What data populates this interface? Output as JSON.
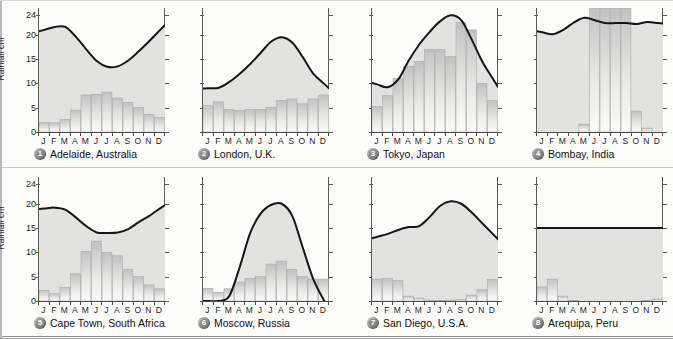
{
  "figure": {
    "axis_label": "Rainfall cm",
    "y_ticks": [
      "24",
      "20",
      "15",
      "10",
      "5",
      "0"
    ],
    "y_tick_values": [
      24,
      20,
      15,
      10,
      5,
      0
    ],
    "y_min": 0,
    "y_max": 25.5,
    "months": [
      "J",
      "F",
      "M",
      "A",
      "M",
      "J",
      "J",
      "A",
      "S",
      "O",
      "N",
      "D"
    ],
    "curve_color": "#151515",
    "bar_color": "#c9c9c9",
    "fill_color": "#e2e2e0",
    "badge_color": "#8b8b8b"
  },
  "chart_data": [
    {
      "type": "bar",
      "id": "1",
      "title": "Adelaide, Australia",
      "ylabel": "Rainfall cm",
      "xlabel": "",
      "ylim": [
        0,
        25.5
      ],
      "categories": [
        "J",
        "F",
        "M",
        "A",
        "M",
        "J",
        "J",
        "A",
        "S",
        "O",
        "N",
        "D"
      ],
      "series": [
        {
          "name": "Rainfall",
          "kind": "bar",
          "values": [
            1.9,
            1.9,
            2.6,
            4.5,
            7.6,
            7.7,
            8.2,
            7.0,
            6.1,
            5.0,
            3.6,
            3.0
          ]
        },
        {
          "name": "Temperature curve",
          "kind": "line",
          "values": [
            21.0,
            21.6,
            21.6,
            19.6,
            17.0,
            14.6,
            13.4,
            13.5,
            14.7,
            16.6,
            18.7,
            20.9
          ]
        }
      ]
    },
    {
      "type": "bar",
      "id": "2",
      "title": "London, U.K.",
      "ylabel": "",
      "xlabel": "",
      "ylim": [
        0,
        25.5
      ],
      "categories": [
        "J",
        "F",
        "M",
        "A",
        "M",
        "J",
        "J",
        "A",
        "S",
        "O",
        "N",
        "D"
      ],
      "series": [
        {
          "name": "Rainfall",
          "kind": "bar",
          "values": [
            5.4,
            6.2,
            4.6,
            4.4,
            4.6,
            4.6,
            5.0,
            6.5,
            6.8,
            5.8,
            6.8,
            7.6
          ]
        },
        {
          "name": "Temperature curve",
          "kind": "line",
          "values": [
            9.0,
            9.1,
            10.3,
            12.0,
            14.0,
            16.3,
            18.6,
            19.5,
            18.4,
            15.4,
            12.0,
            10.0
          ]
        }
      ]
    },
    {
      "type": "bar",
      "id": "3",
      "title": "Tokyo, Japan",
      "ylabel": "",
      "xlabel": "",
      "ylim": [
        0,
        25.5
      ],
      "categories": [
        "J",
        "F",
        "M",
        "A",
        "M",
        "J",
        "J",
        "A",
        "S",
        "O",
        "N",
        "D"
      ],
      "series": [
        {
          "name": "Rainfall",
          "kind": "bar",
          "values": [
            5.2,
            7.5,
            11.0,
            13.5,
            14.5,
            17.0,
            17.0,
            15.5,
            22.5,
            21.0,
            10.0,
            6.5
          ]
        },
        {
          "name": "Temperature curve",
          "kind": "line",
          "values": [
            9.8,
            9.2,
            10.8,
            14.7,
            18.0,
            20.6,
            22.8,
            24.0,
            23.0,
            19.0,
            14.5,
            11.0
          ]
        }
      ]
    },
    {
      "type": "bar",
      "id": "4",
      "title": "Bombay, India",
      "ylabel": "",
      "xlabel": "",
      "ylim": [
        0,
        25.5
      ],
      "categories": [
        "J",
        "F",
        "M",
        "A",
        "M",
        "J",
        "J",
        "A",
        "S",
        "O",
        "N",
        "D"
      ],
      "series": [
        {
          "name": "Rainfall",
          "kind": "bar",
          "values": [
            0.0,
            0.0,
            0.0,
            0.0,
            1.6,
            25.5,
            25.5,
            25.5,
            25.5,
            4.3,
            0.8,
            0.0
          ]
        },
        {
          "name": "Temperature curve",
          "kind": "line",
          "values": [
            20.5,
            20.1,
            21.0,
            22.5,
            23.5,
            23.0,
            22.4,
            22.4,
            22.4,
            22.2,
            22.6,
            22.4
          ]
        }
      ]
    },
    {
      "type": "bar",
      "id": "5",
      "title": "Cape Town, South Africa",
      "ylabel": "Rainfall cm",
      "xlabel": "",
      "ylim": [
        0,
        25.5
      ],
      "categories": [
        "J",
        "F",
        "M",
        "A",
        "M",
        "J",
        "J",
        "A",
        "S",
        "O",
        "N",
        "D"
      ],
      "series": [
        {
          "name": "Rainfall",
          "kind": "bar",
          "values": [
            2.2,
            1.5,
            2.8,
            5.6,
            10.2,
            12.3,
            10.0,
            9.3,
            6.5,
            5.0,
            3.3,
            2.5
          ]
        },
        {
          "name": "Temperature curve",
          "kind": "line",
          "values": [
            19.0,
            19.2,
            18.8,
            17.2,
            15.4,
            14.1,
            14.0,
            14.1,
            14.8,
            16.2,
            17.5,
            19.0
          ]
        }
      ]
    },
    {
      "type": "bar",
      "id": "6",
      "title": "Moscow, Russia",
      "ylabel": "",
      "xlabel": "",
      "ylim": [
        0,
        25.5
      ],
      "categories": [
        "J",
        "F",
        "M",
        "A",
        "M",
        "J",
        "J",
        "A",
        "S",
        "O",
        "N",
        "D"
      ],
      "series": [
        {
          "name": "Rainfall",
          "kind": "bar",
          "values": [
            2.6,
            1.8,
            2.5,
            3.9,
            4.6,
            5.0,
            7.6,
            8.2,
            6.5,
            5.0,
            4.5,
            4.5
          ]
        },
        {
          "name": "Temperature curve",
          "kind": "line",
          "values": [
            -0.5,
            -0.8,
            1.0,
            7.0,
            14.0,
            18.0,
            19.8,
            20.0,
            17.5,
            11.0,
            4.5,
            0.2
          ]
        }
      ]
    },
    {
      "type": "bar",
      "id": "7",
      "title": "San Diego, U.S.A.",
      "ylabel": "",
      "xlabel": "",
      "ylim": [
        0,
        25.5
      ],
      "categories": [
        "J",
        "F",
        "M",
        "A",
        "M",
        "J",
        "J",
        "A",
        "S",
        "O",
        "N",
        "D"
      ],
      "series": [
        {
          "name": "Rainfall",
          "kind": "bar",
          "values": [
            4.5,
            4.6,
            4.2,
            1.0,
            0.6,
            0.2,
            0.1,
            0.2,
            0.3,
            1.2,
            2.3,
            4.4
          ]
        },
        {
          "name": "Temperature curve",
          "kind": "line",
          "values": [
            13.2,
            13.8,
            14.6,
            15.2,
            15.4,
            17.3,
            19.6,
            20.5,
            20.0,
            18.2,
            16.0,
            13.8
          ]
        }
      ]
    },
    {
      "type": "bar",
      "id": "8",
      "title": "Arequipa, Peru",
      "ylabel": "",
      "xlabel": "",
      "ylim": [
        0,
        25.5
      ],
      "categories": [
        "J",
        "F",
        "M",
        "A",
        "M",
        "J",
        "J",
        "A",
        "S",
        "O",
        "N",
        "D"
      ],
      "series": [
        {
          "name": "Rainfall",
          "kind": "bar",
          "values": [
            2.9,
            4.5,
            1.0,
            0.1,
            0.0,
            0.0,
            0.0,
            0.0,
            0.0,
            0.0,
            0.1,
            0.4
          ]
        },
        {
          "name": "Temperature curve",
          "kind": "line",
          "values": [
            15.0,
            15.0,
            15.0,
            15.0,
            15.0,
            15.0,
            15.0,
            15.0,
            15.0,
            15.0,
            15.0,
            15.0
          ]
        }
      ]
    }
  ]
}
